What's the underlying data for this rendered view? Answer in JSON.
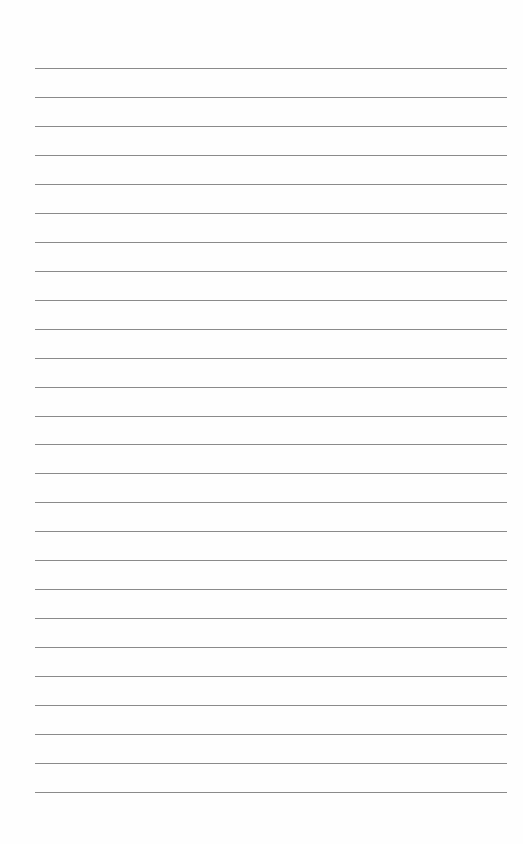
{
  "page": {
    "type": "lined-paper",
    "background_color": "#fefefe",
    "line_color": "#8a8a8a",
    "line_count": 26,
    "first_line_y": 68,
    "line_spacing": 28.96,
    "line_left": 35,
    "line_width": 472
  }
}
